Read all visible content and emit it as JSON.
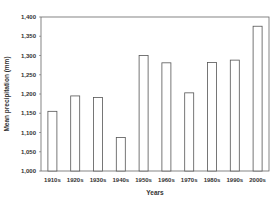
{
  "chart_data": {
    "type": "bar",
    "title": "",
    "xlabel": "Years",
    "ylabel": "Mean precipitation (mm)",
    "categories": [
      "1910s",
      "1920s",
      "1930s",
      "1940s",
      "1950s",
      "1960s",
      "1970s",
      "1980s",
      "1990s",
      "2000s"
    ],
    "values": [
      1155,
      1195,
      1191,
      1087,
      1300,
      1281,
      1203,
      1282,
      1288,
      1376
    ],
    "ylim": [
      1000,
      1400
    ],
    "yticks": [
      1000,
      1050,
      1100,
      1150,
      1200,
      1250,
      1300,
      1350,
      1400
    ],
    "ytick_labels": [
      "1,000",
      "1,050",
      "1,100",
      "1,150",
      "1,200",
      "1,250",
      "1,300",
      "1,350",
      "1,400"
    ],
    "grid": false,
    "legend": null,
    "bar_fill": "#ffffff",
    "bar_stroke": "#555555",
    "frame_color": "#666666"
  }
}
